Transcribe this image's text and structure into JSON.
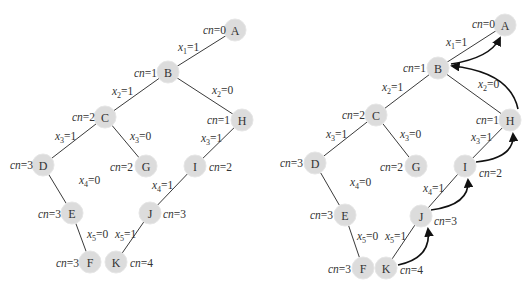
{
  "figure": {
    "left_tree": {
      "name": "search-tree",
      "nodes": [
        {
          "id": "A",
          "x": 235,
          "y": 30,
          "cn": "cn=0",
          "cn_x": 203,
          "cn_y": 30
        },
        {
          "id": "B",
          "x": 168,
          "y": 72,
          "cn": "cn=1",
          "cn_x": 134,
          "cn_y": 73
        },
        {
          "id": "C",
          "x": 105,
          "y": 117,
          "cn": "cn=2",
          "cn_x": 72,
          "cn_y": 117
        },
        {
          "id": "D",
          "x": 43,
          "y": 165,
          "cn": "cn=3",
          "cn_x": 10,
          "cn_y": 165
        },
        {
          "id": "E",
          "x": 72,
          "y": 213,
          "cn": "cn=3",
          "cn_x": 38,
          "cn_y": 214
        },
        {
          "id": "F",
          "x": 90,
          "y": 262,
          "cn": "cn=3",
          "cn_x": 56,
          "cn_y": 263
        },
        {
          "id": "G",
          "x": 146,
          "y": 166,
          "cn": "cn=2",
          "cn_x": 110,
          "cn_y": 167
        },
        {
          "id": "H",
          "x": 242,
          "y": 120,
          "cn": "cn=1",
          "cn_x": 207,
          "cn_y": 120
        },
        {
          "id": "I",
          "x": 195,
          "y": 166,
          "cn": "cn=2",
          "cn_x": 209,
          "cn_y": 167
        },
        {
          "id": "J",
          "x": 150,
          "y": 213,
          "cn": "cn=3",
          "cn_x": 163,
          "cn_y": 214
        },
        {
          "id": "K",
          "x": 116,
          "y": 262,
          "cn": "cn=4",
          "cn_x": 130,
          "cn_y": 263
        }
      ],
      "edges": [
        {
          "from": "A",
          "to": "B",
          "var": "x",
          "sub": "1",
          "val": "=1",
          "lx": 178,
          "ly": 51
        },
        {
          "from": "B",
          "to": "C",
          "var": "x",
          "sub": "2",
          "val": "=1",
          "lx": 112,
          "ly": 95
        },
        {
          "from": "B",
          "to": "H",
          "var": "x",
          "sub": "2",
          "val": "=0",
          "lx": 212,
          "ly": 94
        },
        {
          "from": "C",
          "to": "D",
          "var": "x",
          "sub": "3",
          "val": "=1",
          "lx": 55,
          "ly": 140
        },
        {
          "from": "C",
          "to": "G",
          "var": "x",
          "sub": "3",
          "val": "=0",
          "lx": 130,
          "ly": 140
        },
        {
          "from": "D",
          "to": "E",
          "var": "x",
          "sub": "4",
          "val": "=0",
          "lx": 79,
          "ly": 184
        },
        {
          "from": "E",
          "to": "F",
          "var": "x",
          "sub": "5",
          "val": "=0",
          "lx": 87,
          "ly": 238
        },
        {
          "from": "H",
          "to": "I",
          "var": "x",
          "sub": "3",
          "val": "=1",
          "lx": 201,
          "ly": 142
        },
        {
          "from": "I",
          "to": "J",
          "var": "x",
          "sub": "4",
          "val": "=1",
          "lx": 152,
          "ly": 189
        },
        {
          "from": "J",
          "to": "K",
          "var": "x",
          "sub": "5",
          "val": "=1",
          "lx": 115,
          "ly": 238
        }
      ]
    },
    "right_tree": {
      "name": "search-tree-with-backtracking",
      "nodes": [
        {
          "id": "A",
          "x": 505,
          "y": 25,
          "cn": "cn=0",
          "cn_x": 472,
          "cn_y": 24
        },
        {
          "id": "B",
          "x": 438,
          "y": 68,
          "cn": "cn=1",
          "cn_x": 403,
          "cn_y": 68
        },
        {
          "id": "C",
          "x": 376,
          "y": 115,
          "cn": "cn=2",
          "cn_x": 342,
          "cn_y": 115
        },
        {
          "id": "D",
          "x": 315,
          "y": 163,
          "cn": "cn=3",
          "cn_x": 280,
          "cn_y": 163
        },
        {
          "id": "E",
          "x": 345,
          "y": 215,
          "cn": "cn=3",
          "cn_x": 310,
          "cn_y": 215
        },
        {
          "id": "F",
          "x": 363,
          "y": 268,
          "cn": "cn=3",
          "cn_x": 328,
          "cn_y": 269
        },
        {
          "id": "G",
          "x": 416,
          "y": 166,
          "cn": "cn=2",
          "cn_x": 380,
          "cn_y": 167
        },
        {
          "id": "H",
          "x": 510,
          "y": 120,
          "cn": "cn=1",
          "cn_x": 476,
          "cn_y": 120
        },
        {
          "id": "I",
          "x": 465,
          "y": 166,
          "cn": "cn=2",
          "cn_x": 479,
          "cn_y": 173
        },
        {
          "id": "J",
          "x": 421,
          "y": 216,
          "cn": "cn=3",
          "cn_x": 434,
          "cn_y": 221
        },
        {
          "id": "K",
          "x": 386,
          "y": 268,
          "cn": "cn=4",
          "cn_x": 400,
          "cn_y": 270
        }
      ],
      "edges": [
        {
          "from": "A",
          "to": "B",
          "var": "x",
          "sub": "1",
          "val": "=1",
          "lx": 446,
          "ly": 46
        },
        {
          "from": "B",
          "to": "C",
          "var": "x",
          "sub": "2",
          "val": "=1",
          "lx": 382,
          "ly": 91
        },
        {
          "from": "B",
          "to": "H",
          "var": "x",
          "sub": "2",
          "val": "=0",
          "lx": 478,
          "ly": 88
        },
        {
          "from": "C",
          "to": "D",
          "var": "x",
          "sub": "3",
          "val": "=1",
          "lx": 326,
          "ly": 138
        },
        {
          "from": "C",
          "to": "G",
          "var": "x",
          "sub": "3",
          "val": "=0",
          "lx": 400,
          "ly": 138
        },
        {
          "from": "D",
          "to": "E",
          "var": "x",
          "sub": "4",
          "val": "=0",
          "lx": 350,
          "ly": 186
        },
        {
          "from": "E",
          "to": "F",
          "var": "x",
          "sub": "5",
          "val": "=0",
          "lx": 357,
          "ly": 240
        },
        {
          "from": "H",
          "to": "I",
          "var": "x",
          "sub": "3",
          "val": "=1",
          "lx": 471,
          "ly": 141
        },
        {
          "from": "I",
          "to": "J",
          "var": "x",
          "sub": "4",
          "val": "=1",
          "lx": 423,
          "ly": 192
        },
        {
          "from": "J",
          "to": "K",
          "var": "x",
          "sub": "5",
          "val": "=1",
          "lx": 385,
          "ly": 240
        }
      ],
      "backtrack_arrows": [
        {
          "from": "K",
          "to": "J",
          "d": "M398,265 Q432,258 428,229"
        },
        {
          "from": "J",
          "to": "I",
          "d": "M431,210 Q470,205 468,180"
        },
        {
          "from": "I",
          "to": "H",
          "d": "M476,162 Q515,158 513,134"
        },
        {
          "from": "H",
          "to": "B",
          "d": "M518,109 Q510,72 452,66"
        },
        {
          "from": "B",
          "to": "A",
          "d": "M451,64 Q490,58 500,38"
        }
      ]
    }
  }
}
